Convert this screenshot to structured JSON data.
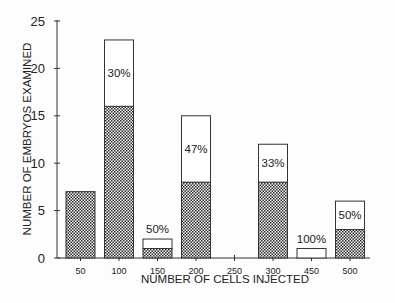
{
  "chart_data": {
    "type": "bar",
    "stacked": true,
    "title": "",
    "xlabel": "NUMBER OF CELLS INJECTED",
    "ylabel": "NUMBER OF EMBRYOS EXAMINED",
    "ylim": [
      0,
      25
    ],
    "yticks": [
      0,
      5,
      10,
      15,
      20,
      25
    ],
    "categories": [
      "50",
      "100",
      "150",
      "200",
      "250",
      "300",
      "450",
      "500"
    ],
    "series": [
      {
        "name": "hatched",
        "pattern": "crosshatch",
        "values": [
          7,
          16,
          1,
          8,
          0,
          8,
          0,
          3
        ]
      },
      {
        "name": "open",
        "pattern": "none",
        "values": [
          0,
          7,
          1,
          7,
          0,
          4,
          1,
          3
        ]
      }
    ],
    "totals": [
      7,
      23,
      2,
      15,
      0,
      12,
      1,
      6
    ],
    "bar_labels": [
      "",
      "30%",
      "50%",
      "47%",
      "",
      "33%",
      "100%",
      "50%"
    ],
    "label_position": [
      "",
      "inside",
      "above",
      "inside",
      "",
      "inside",
      "above",
      "inside"
    ],
    "grid": false,
    "legend": "none"
  }
}
